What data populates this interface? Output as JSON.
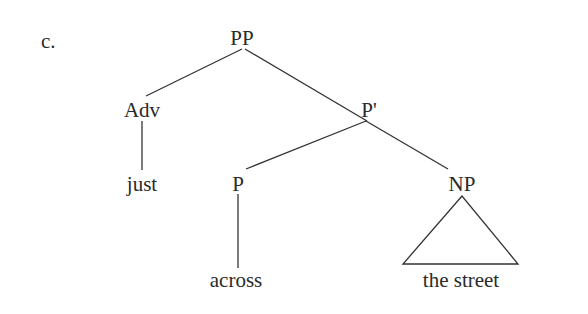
{
  "example_label": "c.",
  "nodes": {
    "pp": "PP",
    "adv": "Adv",
    "pbar": "P'",
    "just": "just",
    "p": "P",
    "np": "NP",
    "across": "across",
    "the_street": "the street"
  },
  "colors": {
    "line": "#333333",
    "text": "#2a2a2a"
  }
}
